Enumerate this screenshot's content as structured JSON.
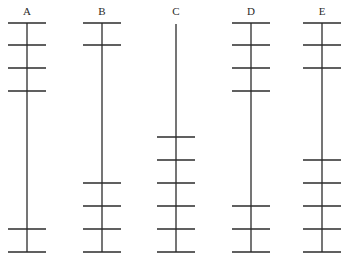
{
  "diagram": {
    "title": "",
    "line_color": "#2b2b2b",
    "background": "#ffffff",
    "columns": [
      {
        "label": "A",
        "x": 27,
        "line_top": 23,
        "line_bottom": 252,
        "ticks": [
          23,
          45,
          68,
          91,
          229,
          252
        ]
      },
      {
        "label": "B",
        "x": 102,
        "line_top": 23,
        "line_bottom": 252,
        "ticks": [
          23,
          45,
          183,
          206,
          229,
          252
        ]
      },
      {
        "label": "C",
        "x": 176,
        "line_top": 24,
        "line_bottom": 252,
        "ticks": [
          137,
          160,
          183,
          206,
          229,
          252
        ]
      },
      {
        "label": "D",
        "x": 251,
        "line_top": 23,
        "line_bottom": 252,
        "ticks": [
          23,
          45,
          68,
          91,
          206,
          229,
          252
        ]
      },
      {
        "label": "E",
        "x": 322,
        "line_top": 23,
        "line_bottom": 252,
        "ticks": [
          23,
          45,
          68,
          160,
          183,
          206,
          229,
          252
        ]
      }
    ],
    "tick_half_width": 19,
    "label_y": 15
  }
}
